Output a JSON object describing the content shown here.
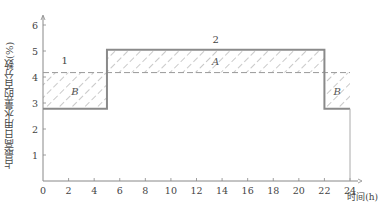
{
  "chart_data": {
    "type": "line",
    "title": "",
    "xlabel": "时间(h)",
    "ylabel": "占最高日用水量的百分数(%)",
    "xlim": [
      0,
      24
    ],
    "ylim": [
      0,
      6
    ],
    "x_ticks": [
      "0",
      "2",
      "4",
      "6",
      "8",
      "10",
      "12",
      "14",
      "16",
      "18",
      "20",
      "22",
      "24"
    ],
    "y_ticks": [
      "1",
      "2",
      "3",
      "4",
      "5",
      "6"
    ],
    "grid": false,
    "series": [
      {
        "name": "1",
        "style": "dashed",
        "x": [
          0,
          24
        ],
        "y": [
          4.17,
          4.17
        ]
      },
      {
        "name": "2",
        "style": "solid-step",
        "x": [
          0,
          5,
          5,
          22,
          22,
          24
        ],
        "y": [
          2.78,
          2.78,
          5.05,
          5.05,
          2.78,
          2.78
        ]
      }
    ],
    "regions": [
      {
        "label": "B",
        "x": [
          0,
          5
        ],
        "y": [
          2.78,
          4.17
        ]
      },
      {
        "label": "A",
        "x": [
          5,
          22
        ],
        "y": [
          4.17,
          5.05
        ]
      },
      {
        "label": "B",
        "x": [
          22,
          24
        ],
        "y": [
          2.78,
          4.17
        ]
      }
    ],
    "annotations": [
      {
        "text": "1",
        "x": 1.7,
        "y": 4.5
      },
      {
        "text": "2",
        "x": 13.5,
        "y": 5.3
      }
    ]
  },
  "labels": {
    "ylabel": "占最高日用水量的百分数(%)",
    "xlabel": "时间(h)",
    "line1": "1",
    "line2": "2",
    "regionA": "A",
    "regionB": "B"
  }
}
